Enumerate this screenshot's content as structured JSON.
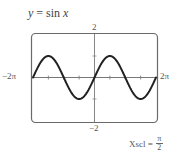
{
  "chart_data": {
    "type": "line",
    "title": "y = sin x",
    "function": "sin x",
    "xlabel": "",
    "ylabel": "",
    "xlim": [
      -6.283,
      6.283
    ],
    "ylim": [
      -2,
      2
    ],
    "x_tick_labels": {
      "min": "−2π",
      "max": "2π"
    },
    "y_tick_labels": {
      "max": "2",
      "min": "−2"
    },
    "xscl": "π/2",
    "yscl": 1,
    "grid": false,
    "series": [
      {
        "name": "y = sin x",
        "x": [
          -6.283,
          -5.498,
          -4.712,
          -3.927,
          -3.142,
          -2.356,
          -1.571,
          -0.785,
          0,
          0.785,
          1.571,
          2.356,
          3.142,
          3.927,
          4.712,
          5.498,
          6.283
        ],
        "values": [
          0,
          0.707,
          1,
          0.707,
          0,
          -0.707,
          -1,
          -0.707,
          0,
          0.707,
          1,
          0.707,
          0,
          -0.707,
          -1,
          -0.707,
          0
        ]
      }
    ]
  },
  "labels": {
    "title_lhs": "y",
    "title_eq": " = sin ",
    "title_var": "x",
    "x_min": "−2π",
    "x_max": "2π",
    "y_max": "2",
    "y_min": "−2",
    "xscl_prefix": "Xscl =",
    "xscl_num": "π",
    "xscl_den": "2"
  },
  "colors": {
    "curve": "#222222",
    "frame": "#666666",
    "axes": "#777777"
  }
}
